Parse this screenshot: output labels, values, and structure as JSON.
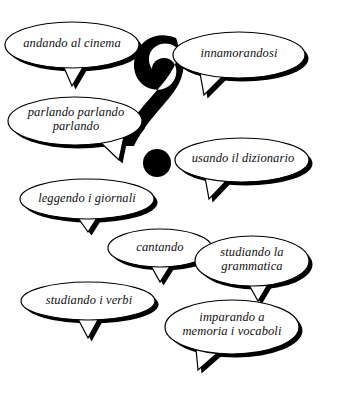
{
  "canvas": {
    "width": 340,
    "height": 398,
    "background_color": "#ffffff",
    "ink_color": "#000000",
    "text_color": "#101010"
  },
  "center_symbol": {
    "glyph": "?",
    "name": "question-mark",
    "color": "#000000"
  },
  "bubbles": [
    {
      "id": "andando-al-cinema",
      "text": "andando al cinema",
      "cx": 72,
      "cy": 45,
      "rx": 67,
      "ry": 23,
      "font_size": 12.5,
      "tail": "bottom-center",
      "tail_points": "62,63 86,62 72,86",
      "text_x": 10,
      "text_y": 36,
      "text_w": 124
    },
    {
      "id": "innamorandosi",
      "text": "innamorandosi",
      "cx": 239,
      "cy": 55,
      "rx": 66,
      "ry": 23,
      "font_size": 12.5,
      "tail": "bottom-left",
      "tail_points": "200,73 226,73 204,95",
      "text_x": 178,
      "text_y": 46,
      "text_w": 122
    },
    {
      "id": "parlando-parlando-parlando",
      "text": "parlando parlando\nparlando",
      "cx": 75,
      "cy": 121,
      "rx": 67,
      "ry": 24,
      "font_size": 12.5,
      "tail": "bottom-right",
      "tail_points": "98,140 124,136 119,160",
      "text_x": 14,
      "text_y": 105,
      "text_w": 124
    },
    {
      "id": "usando-il-dizionario",
      "text": "usando il dizionario",
      "cx": 242,
      "cy": 160,
      "rx": 67,
      "ry": 22,
      "font_size": 12.5,
      "tail": "bottom-left",
      "tail_points": "205,177 230,177 209,199",
      "text_x": 180,
      "text_y": 151,
      "text_w": 126
    },
    {
      "id": "leggendo-i-giornali",
      "text": "leggendo i giornali",
      "cx": 87,
      "cy": 199,
      "rx": 67,
      "ry": 20,
      "font_size": 12.5,
      "tail": "bottom-center",
      "tail_points": "76,215 100,213 88,232",
      "text_x": 25,
      "text_y": 191,
      "text_w": 124
    },
    {
      "id": "cantando",
      "text": "cantando",
      "cx": 160,
      "cy": 248,
      "rx": 52,
      "ry": 19,
      "font_size": 12.5,
      "tail": "bottom-center",
      "tail_points": "150,264 172,263 160,282",
      "text_x": 114,
      "text_y": 240,
      "text_w": 92
    },
    {
      "id": "studiando-la-grammatica",
      "text": "studiando la\ngrammatica",
      "cx": 252,
      "cy": 261,
      "rx": 57,
      "ry": 25,
      "font_size": 12.5,
      "tail": "bottom-center",
      "tail_points": "248,283 270,281 258,301",
      "text_x": 199,
      "text_y": 245,
      "text_w": 106
    },
    {
      "id": "studiando-i-verbi",
      "text": "studiando i verbi",
      "cx": 88,
      "cy": 301,
      "rx": 67,
      "ry": 19,
      "font_size": 12.5,
      "tail": "bottom-center",
      "tail_points": "77,317 100,316 88,338",
      "text_x": 27,
      "text_y": 293,
      "text_w": 124
    },
    {
      "id": "imparando-a-memoria-i-vocaboli",
      "text": "imparando a\nmemoria i vocaboli",
      "cx": 232,
      "cy": 327,
      "rx": 67,
      "ry": 27,
      "font_size": 12.5,
      "tail": "bottom-left",
      "tail_points": "196,349 222,349 198,370",
      "text_x": 170,
      "text_y": 310,
      "text_w": 124
    }
  ]
}
